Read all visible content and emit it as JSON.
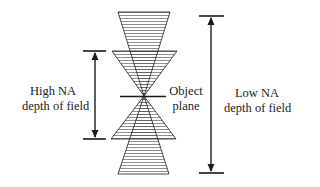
{
  "diagram": {
    "labels": {
      "high_na": {
        "line1": "High NA",
        "line2": "depth of field"
      },
      "object_plane": {
        "line1": "Object",
        "line2": "plane"
      },
      "low_na": {
        "line1": "Low NA",
        "line2": "depth of field"
      }
    },
    "colors": {
      "stroke": "#1a1a1a",
      "background": "#ffffff"
    },
    "elements": [
      "low-na-upper-cone",
      "high-na-upper-cone",
      "high-na-lower-cone",
      "low-na-lower-cone",
      "object-plane-line",
      "high-na-dof-arrow",
      "low-na-dof-arrow"
    ]
  }
}
